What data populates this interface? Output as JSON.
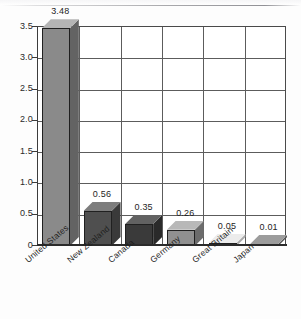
{
  "chart_data": {
    "type": "bar",
    "title": "",
    "subtitle": "",
    "xlabel": "",
    "ylabel": "",
    "ylim": [
      0,
      3.5
    ],
    "grid": true,
    "legend": "none",
    "three_d": true,
    "categories": [
      "United States",
      "New Zealand",
      "Canada",
      "Germany",
      "Great Britain",
      "Japan"
    ],
    "values": [
      3.48,
      0.56,
      0.35,
      0.26,
      0.05,
      0.01
    ],
    "value_labels": [
      "3.48",
      "0.56",
      "0.35",
      "0.26",
      "0.05",
      "0.01"
    ],
    "ytick_values": [
      0,
      0.5,
      1.0,
      1.5,
      2.0,
      2.5,
      3.0,
      3.5
    ],
    "ytick_labels": [
      "0",
      "0.5",
      "1.0",
      "1.5",
      "2.0",
      "2.5",
      "3.0",
      "3.5"
    ],
    "bar_colors": [
      "#8a8a8a",
      "#4f4f4f",
      "#3a3a3a",
      "#909090",
      "#d2d2d2",
      "#6e6e6e"
    ],
    "bar_top_colors": [
      "#b4b4b4",
      "#7d7d7d",
      "#626262",
      "#b8b8b8",
      "#ececec",
      "#9c9c9c"
    ],
    "bar_side_colors": [
      "#636363",
      "#3a3a3a",
      "#2a2a2a",
      "#6c6c6c",
      "#a9a9a9",
      "#545454"
    ]
  },
  "axis": {
    "y_ticks": [
      {
        "label": "3.5",
        "value": 3.5
      },
      {
        "label": "3.0",
        "value": 3.0
      },
      {
        "label": "2.5",
        "value": 2.5
      },
      {
        "label": "2.0",
        "value": 2.0
      },
      {
        "label": "1.5",
        "value": 1.5
      },
      {
        "label": "1.0",
        "value": 1.0
      },
      {
        "label": "0.5",
        "value": 0.5
      },
      {
        "label": "0",
        "value": 0
      }
    ]
  },
  "colors": {
    "frame": "#4a4a4a",
    "grid": "#5c5c5c",
    "baseline": "#2b2b2b",
    "text": "#1e1e1e",
    "background": "#fdfdfd"
  }
}
